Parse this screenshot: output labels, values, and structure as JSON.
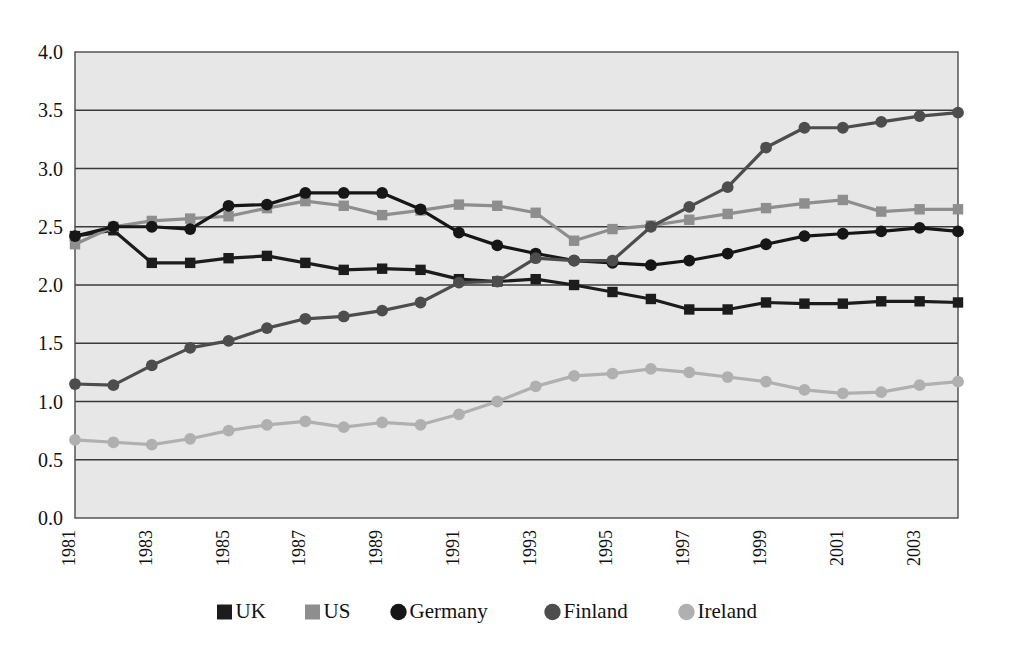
{
  "figure": {
    "cut_off_caption_fragment": "",
    "background_color": "#ffffff",
    "plot_background_color": "#e7e7e7",
    "gridline_color": "#3a3a3a"
  },
  "chart_data": {
    "type": "line",
    "title": "",
    "subtitle": "",
    "xlabel": "",
    "ylabel": "",
    "x": [
      1981,
      1982,
      1983,
      1984,
      1985,
      1986,
      1987,
      1988,
      1989,
      1990,
      1991,
      1992,
      1993,
      1994,
      1995,
      1996,
      1997,
      1998,
      1999,
      2000,
      2001,
      2002,
      2003,
      2004
    ],
    "xtick_labels": [
      "1981",
      "1983",
      "1985",
      "1987",
      "1989",
      "1991",
      "1993",
      "1995",
      "1997",
      "1999",
      "2001",
      "2003"
    ],
    "xtick_values": [
      1981,
      1983,
      1985,
      1987,
      1989,
      1991,
      1993,
      1995,
      1997,
      1999,
      2001,
      2003
    ],
    "xtick_rotation": -90,
    "ytick_labels": [
      "0.0",
      "0.5",
      "1.0",
      "1.5",
      "2.0",
      "2.5",
      "3.0",
      "3.5",
      "4.0"
    ],
    "ytick_values": [
      0.0,
      0.5,
      1.0,
      1.5,
      2.0,
      2.5,
      3.0,
      3.5,
      4.0
    ],
    "ylim": [
      0.0,
      4.0
    ],
    "xlim": [
      1981,
      2004
    ],
    "grid": true,
    "grid_axis": "y",
    "legend_position": "bottom",
    "series": [
      {
        "name": "UK",
        "color": "#1c1c1c",
        "marker": "square",
        "values": [
          2.42,
          2.47,
          2.19,
          2.19,
          2.23,
          2.25,
          2.19,
          2.13,
          2.14,
          2.13,
          2.05,
          2.03,
          2.05,
          2.0,
          1.94,
          1.88,
          1.79,
          1.79,
          1.85,
          1.84,
          1.84,
          1.86,
          1.86,
          1.85
        ]
      },
      {
        "name": "US",
        "color": "#8e8e8e",
        "marker": "square",
        "values": [
          2.35,
          2.5,
          2.55,
          2.57,
          2.59,
          2.66,
          2.72,
          2.68,
          2.6,
          2.64,
          2.69,
          2.68,
          2.62,
          2.38,
          2.48,
          2.51,
          2.56,
          2.61,
          2.66,
          2.7,
          2.73,
          2.63,
          2.65,
          2.65
        ]
      },
      {
        "name": "Germany",
        "color": "#161616",
        "marker": "circle",
        "values": [
          2.42,
          2.5,
          2.5,
          2.48,
          2.68,
          2.69,
          2.79,
          2.79,
          2.79,
          2.65,
          2.45,
          2.34,
          2.27,
          2.21,
          2.19,
          2.17,
          2.21,
          2.27,
          2.35,
          2.42,
          2.44,
          2.46,
          2.49,
          2.46
        ]
      },
      {
        "name": "Finland",
        "color": "#4d4d4d",
        "marker": "circle",
        "values": [
          1.15,
          1.14,
          1.31,
          1.46,
          1.52,
          1.63,
          1.71,
          1.73,
          1.78,
          1.85,
          2.02,
          2.03,
          2.23,
          2.21,
          2.21,
          2.5,
          2.67,
          2.84,
          3.18,
          3.35,
          3.35,
          3.4,
          3.45,
          3.48
        ]
      },
      {
        "name": "Ireland",
        "color": "#b0b0b0",
        "marker": "circle",
        "values": [
          0.67,
          0.65,
          0.63,
          0.68,
          0.75,
          0.8,
          0.83,
          0.78,
          0.82,
          0.8,
          0.89,
          1.0,
          1.13,
          1.22,
          1.24,
          1.28,
          1.25,
          1.21,
          1.17,
          1.1,
          1.07,
          1.08,
          1.14,
          1.17
        ]
      }
    ]
  },
  "legend": {
    "items": [
      {
        "label": "UK",
        "color": "#1c1c1c",
        "marker": "square"
      },
      {
        "label": "US",
        "color": "#8e8e8e",
        "marker": "square"
      },
      {
        "label": "Germany",
        "color": "#161616",
        "marker": "circle"
      },
      {
        "label": "Finland",
        "color": "#4d4d4d",
        "marker": "circle"
      },
      {
        "label": "Ireland",
        "color": "#b0b0b0",
        "marker": "circle"
      }
    ]
  }
}
